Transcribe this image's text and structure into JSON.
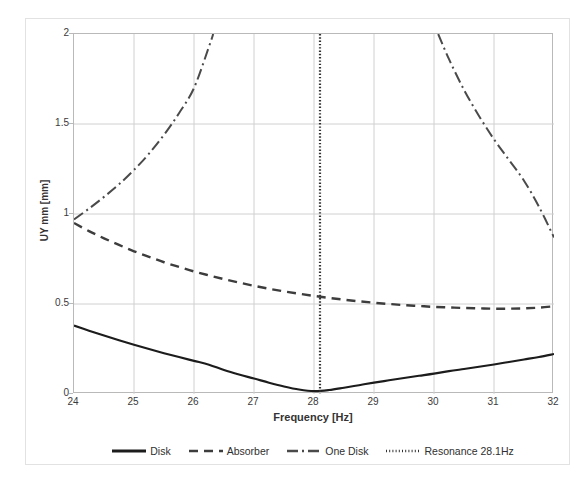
{
  "figure": {
    "background": "#ffffff",
    "frame_color": "#e2e2e2",
    "axis_color": "#b9b9b9",
    "grid_color": "#d0d0d0"
  },
  "axes": {
    "x_title": "Frequency [Hz]",
    "y_title": "UY mm [mm]",
    "x_ticks": [
      "24",
      "25",
      "26",
      "27",
      "28",
      "29",
      "30",
      "31",
      "32"
    ],
    "y_ticks": [
      "0",
      "0.5",
      "1",
      "1.5",
      "2"
    ]
  },
  "legend": {
    "items": [
      {
        "label": "Disk",
        "style": "solid",
        "color": "#1c1c1c"
      },
      {
        "label": "Absorber",
        "style": "dashed",
        "color": "#3d3d3d"
      },
      {
        "label": "One Disk",
        "style": "dashdot",
        "color": "#4a4a4a"
      },
      {
        "label": "Resonance 28.1Hz",
        "style": "dotted",
        "color": "#333333"
      }
    ]
  },
  "chart_data": {
    "type": "line",
    "title": "",
    "xlabel": "Frequency [Hz]",
    "ylabel": "UY mm [mm]",
    "xlim": [
      24,
      32
    ],
    "ylim": [
      0,
      2
    ],
    "xticks": [
      24,
      25,
      26,
      27,
      28,
      29,
      30,
      31,
      32
    ],
    "yticks": [
      0,
      0.5,
      1,
      1.5,
      2
    ],
    "grid": true,
    "legend_position": "bottom",
    "x": [
      24,
      24.25,
      24.5,
      24.75,
      25,
      25.25,
      25.5,
      25.75,
      26,
      26.25,
      26.5,
      26.75,
      27,
      27.25,
      27.5,
      27.75,
      28,
      28.25,
      28.5,
      28.75,
      29,
      29.25,
      29.5,
      29.75,
      30,
      30.25,
      30.5,
      30.75,
      31,
      31.25,
      31.5,
      31.75,
      32
    ],
    "series": [
      {
        "name": "Disk",
        "style": "solid",
        "color": "#1c1c1c",
        "values": [
          0.38,
          0.352,
          0.325,
          0.299,
          0.274,
          0.25,
          0.227,
          0.205,
          0.184,
          0.163,
          0.133,
          0.108,
          0.086,
          0.063,
          0.042,
          0.025,
          0.016,
          0.022,
          0.035,
          0.049,
          0.063,
          0.076,
          0.089,
          0.101,
          0.113,
          0.127,
          0.139,
          0.151,
          0.164,
          0.178,
          0.192,
          0.206,
          0.222
        ]
      },
      {
        "name": "Absorber",
        "style": "dashed",
        "color": "#3d3d3d",
        "values": [
          0.95,
          0.905,
          0.865,
          0.828,
          0.793,
          0.762,
          0.732,
          0.706,
          0.681,
          0.659,
          0.638,
          0.619,
          0.601,
          0.585,
          0.57,
          0.557,
          0.545,
          0.534,
          0.524,
          0.515,
          0.507,
          0.5,
          0.494,
          0.489,
          0.484,
          0.481,
          0.478,
          0.476,
          0.474,
          0.474,
          0.476,
          0.48,
          0.487
        ]
      },
      {
        "name": "One Disk",
        "style": "dashdot",
        "color": "#4a4a4a",
        "note": "Resonant response of single disk: rises to pole near 28.1 Hz from both sides, clipped at ylim 2.",
        "values_left_branch": {
          "x": [
            24,
            24.25,
            24.5,
            24.75,
            25,
            25.25,
            25.5,
            25.75,
            26,
            26.25,
            26.32
          ],
          "y": [
            0.97,
            1.03,
            1.095,
            1.165,
            1.245,
            1.335,
            1.44,
            1.56,
            1.7,
            1.93,
            2.0
          ]
        },
        "values_right_branch": {
          "x": [
            30.07,
            30.25,
            30.5,
            30.75,
            31,
            31.25,
            31.5,
            31.75,
            32
          ],
          "y": [
            2.0,
            1.86,
            1.69,
            1.545,
            1.415,
            1.3,
            1.185,
            1.04,
            0.87
          ]
        }
      },
      {
        "name": "Resonance 28.1Hz",
        "style": "dotted",
        "color": "#333333",
        "type": "vline",
        "x_value": 28.1
      }
    ]
  }
}
